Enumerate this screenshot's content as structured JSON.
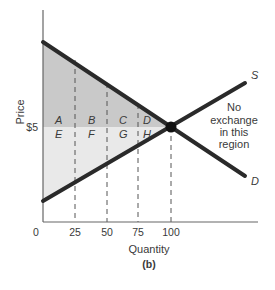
{
  "figure": {
    "caption": "(b)",
    "colors": {
      "background": "#ffffff",
      "consumer_surplus_fill": "#c9c9c9",
      "producer_surplus_fill": "#e9e9e9",
      "curve": "#2a2a2a",
      "axis": "#666666",
      "dashed": "#555555",
      "text": "#3a3a3a"
    }
  },
  "axes": {
    "x_label": "Quantity",
    "y_label": "Price",
    "x_ticks": [
      "0",
      "25",
      "50",
      "75",
      "100"
    ],
    "y_ticks": [
      "$5"
    ]
  },
  "curves": {
    "supply_label": "S",
    "demand_label": "D"
  },
  "regions": {
    "upper": [
      "A",
      "B",
      "C",
      "D"
    ],
    "lower": [
      "E",
      "F",
      "G",
      "H"
    ]
  },
  "annotation": {
    "line1": "No",
    "line2": "exchange",
    "line3": "in this",
    "line4": "region"
  },
  "equilibrium": {
    "price": "$5",
    "quantity": "100"
  }
}
